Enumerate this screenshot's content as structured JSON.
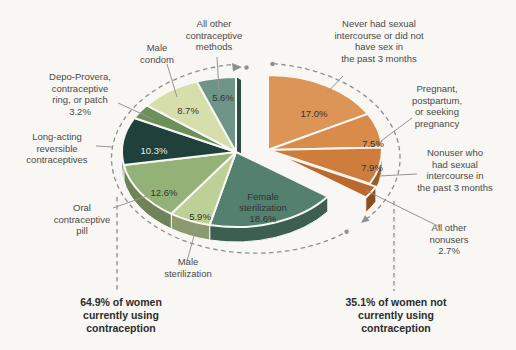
{
  "figure": {
    "background": "#F8F7F3",
    "annotation_color": "#8f8f8f"
  },
  "chart_data": {
    "type": "pie",
    "unit": "%",
    "legend_position": "callout-labels",
    "groups": [
      {
        "id": "users",
        "value": 64.9,
        "summary_label": "64.9% of women\ncurrently using\ncontraception"
      },
      {
        "id": "nonusers",
        "value": 35.1,
        "summary_label": "35.1% of women not\ncurrently using\ncontraception"
      }
    ],
    "slices": [
      {
        "label": "Never had sexual intercourse or did not have sex in the past 3 months",
        "value": 17.0,
        "pct_label": "17.0%",
        "group": "nonusers",
        "color": "#DC9457"
      },
      {
        "label": "Pregnant, postpartum, or seeking pregnancy",
        "value": 7.5,
        "pct_label": "7.5%",
        "group": "nonusers",
        "color": "#D88C4B"
      },
      {
        "label": "Nonuser who had sexual intercourse in the past 3 months",
        "value": 7.9,
        "pct_label": "7.9%",
        "group": "nonusers",
        "color": "#CE7D3C"
      },
      {
        "label": "All other nonusers",
        "value": 2.7,
        "pct_label": "2.7%",
        "group": "nonusers",
        "color": "#BA6A2F"
      },
      {
        "label": "Female sterilization",
        "value": 18.6,
        "pct_label": "18.6%",
        "group": "users",
        "color": "#53806F"
      },
      {
        "label": "Male sterilization",
        "value": 5.9,
        "pct_label": "5.9%",
        "group": "users",
        "color": "#BDD096"
      },
      {
        "label": "Oral contraceptive pill",
        "value": 12.6,
        "pct_label": "12.6%",
        "group": "users",
        "color": "#94B178"
      },
      {
        "label": "Long-acting reversible contraceptives",
        "value": 10.3,
        "pct_label": "10.3%",
        "group": "users",
        "color": "#20413B"
      },
      {
        "label": "Depo-Provera, contraceptive ring, or patch",
        "value": 3.2,
        "pct_label": "3.2%",
        "group": "users",
        "color": "#6C9058"
      },
      {
        "label": "Male condom",
        "value": 8.7,
        "pct_label": "8.7%",
        "group": "users",
        "color": "#D6DEAC"
      },
      {
        "label": "All other contraceptive methods",
        "value": 5.6,
        "pct_label": "5.6%",
        "group": "users",
        "color": "#6D9486"
      }
    ]
  },
  "callouts": {
    "all_other_methods": "All other\ncontraceptive\nmethods",
    "male_condom": "Male\ncondom",
    "depo_provera": "Depo-Provera,\ncontraceptive\nring, or patch\n3.2%",
    "larc": "Long-acting\nreversible\ncontraceptives",
    "oral_pill": "Oral\ncontraceptive\npill",
    "male_sterilization": "Male\nsterilization",
    "never_had_sex": "Never had sexual\nintercourse or did not\nhave sex in\nthe past 3 months",
    "pregnant": "Pregnant,\npostpartum,\nor seeking\npregnancy",
    "nonuser_had_sex": "Nonuser who\nhad sexual\nintercourse in\nthe past 3 months",
    "all_other_nonusers": "All other\nnonusers\n2.7%"
  }
}
